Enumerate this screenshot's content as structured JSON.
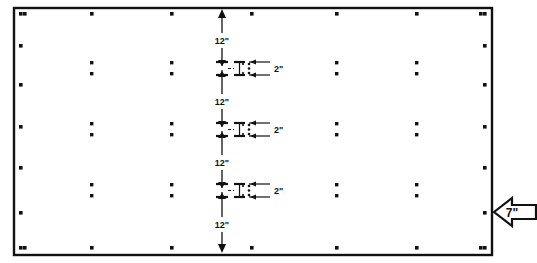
{
  "diagram": {
    "panel": {
      "x": 14,
      "y": 8,
      "width": 478,
      "height": 247,
      "stroke_color": "#111111"
    },
    "colors": {
      "ink": "#111111",
      "paper": "#ffffff"
    },
    "edge_fasteners": {
      "top": [
        {
          "x": 25,
          "y": 14
        },
        {
          "x": 92,
          "y": 14
        },
        {
          "x": 172,
          "y": 14
        },
        {
          "x": 252,
          "y": 14
        },
        {
          "x": 337,
          "y": 14
        },
        {
          "x": 417,
          "y": 14
        },
        {
          "x": 481,
          "y": 14
        }
      ],
      "bottom": [
        {
          "x": 25,
          "y": 248
        },
        {
          "x": 92,
          "y": 248
        },
        {
          "x": 172,
          "y": 248
        },
        {
          "x": 252,
          "y": 248
        },
        {
          "x": 337,
          "y": 248
        },
        {
          "x": 417,
          "y": 248
        },
        {
          "x": 481,
          "y": 248
        }
      ],
      "left": [
        {
          "x": 21,
          "y": 14
        },
        {
          "x": 21,
          "y": 46
        },
        {
          "x": 21,
          "y": 85
        },
        {
          "x": 21,
          "y": 127
        },
        {
          "x": 21,
          "y": 168
        },
        {
          "x": 21,
          "y": 213
        },
        {
          "x": 21,
          "y": 248
        }
      ],
      "right": [
        {
          "x": 485,
          "y": 14
        },
        {
          "x": 485,
          "y": 46
        },
        {
          "x": 485,
          "y": 85
        },
        {
          "x": 485,
          "y": 127
        },
        {
          "x": 485,
          "y": 168
        },
        {
          "x": 485,
          "y": 213
        },
        {
          "x": 485,
          "y": 248
        }
      ]
    },
    "interior_fasteners": {
      "columns_x": [
        92,
        172,
        337,
        417
      ],
      "row_pairs_y": [
        [
          63,
          74
        ],
        [
          124,
          135
        ],
        [
          185,
          196
        ]
      ]
    },
    "dimension_line": {
      "x": 222,
      "y_top": 10,
      "y_bottom": 252,
      "label": "12\"",
      "segments": [
        {
          "y_start": 10,
          "y_end": 68,
          "label": "12\"",
          "label_y": 40
        },
        {
          "y_start": 68,
          "y_end": 129,
          "label": "12\"",
          "label_y": 101
        },
        {
          "y_start": 129,
          "y_end": 190,
          "label": "12\"",
          "label_y": 162
        },
        {
          "y_start": 190,
          "y_end": 252,
          "label": "12\"",
          "label_y": 224
        }
      ]
    },
    "detail_callouts": [
      {
        "y": 68,
        "label": "2\"",
        "label_x": 274
      },
      {
        "y": 129,
        "label": "2\"",
        "label_x": 274
      },
      {
        "y": 190,
        "label": "2\"",
        "label_x": 274
      }
    ],
    "edge_callout": {
      "label": "7\"",
      "label_x": 516,
      "label_y": 217,
      "tip_x": 492,
      "tip_y": 212
    }
  }
}
